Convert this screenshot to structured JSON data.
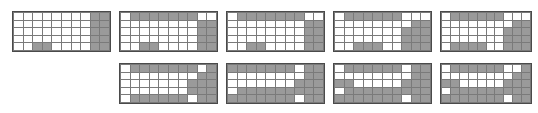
{
  "figure": {
    "type": "grid-pattern-series",
    "canvas": {
      "width": 538,
      "height": 113,
      "background": "#ffffff"
    },
    "cell_colors": {
      "filled": "#9a9a9a",
      "empty": "#ffffff",
      "gridline": "#7a7a7a",
      "border": "#4a4a4a"
    },
    "grid_shape": {
      "columns": 10,
      "rows": 5
    },
    "panel_count": 9,
    "rows_layout": [
      5,
      4
    ]
  },
  "panels": [
    {
      "id": "panel-1",
      "position": {
        "x": 12,
        "y": 11,
        "width": 99,
        "height": 41
      },
      "cells": [
        [
          0,
          0,
          0,
          0,
          0,
          0,
          0,
          0,
          1,
          1
        ],
        [
          0,
          0,
          0,
          0,
          0,
          0,
          0,
          0,
          1,
          1
        ],
        [
          0,
          0,
          0,
          0,
          0,
          0,
          0,
          0,
          1,
          1
        ],
        [
          0,
          0,
          0,
          0,
          0,
          0,
          0,
          0,
          1,
          1
        ],
        [
          0,
          0,
          1,
          1,
          0,
          0,
          0,
          0,
          1,
          1
        ]
      ]
    },
    {
      "id": "panel-2",
      "position": {
        "x": 119,
        "y": 11,
        "width": 99,
        "height": 41
      },
      "cells": [
        [
          0,
          1,
          1,
          1,
          1,
          1,
          1,
          1,
          0,
          0
        ],
        [
          0,
          0,
          0,
          0,
          0,
          0,
          0,
          0,
          1,
          1
        ],
        [
          0,
          0,
          0,
          0,
          0,
          0,
          0,
          0,
          1,
          1
        ],
        [
          0,
          0,
          0,
          0,
          0,
          0,
          0,
          0,
          1,
          1
        ],
        [
          0,
          0,
          1,
          1,
          0,
          0,
          0,
          0,
          1,
          1
        ]
      ]
    },
    {
      "id": "panel-3",
      "position": {
        "x": 226,
        "y": 11,
        "width": 99,
        "height": 41
      },
      "cells": [
        [
          0,
          1,
          1,
          1,
          1,
          1,
          1,
          1,
          0,
          0
        ],
        [
          0,
          0,
          0,
          0,
          0,
          0,
          0,
          0,
          1,
          1
        ],
        [
          0,
          0,
          0,
          0,
          0,
          0,
          0,
          0,
          1,
          1
        ],
        [
          0,
          0,
          0,
          0,
          0,
          0,
          0,
          0,
          1,
          1
        ],
        [
          0,
          0,
          1,
          1,
          0,
          0,
          0,
          0,
          1,
          1
        ]
      ]
    },
    {
      "id": "panel-4",
      "position": {
        "x": 333,
        "y": 11,
        "width": 99,
        "height": 41
      },
      "cells": [
        [
          0,
          1,
          1,
          1,
          1,
          1,
          1,
          0,
          0,
          0
        ],
        [
          0,
          0,
          0,
          0,
          0,
          0,
          0,
          0,
          1,
          1
        ],
        [
          0,
          0,
          0,
          0,
          0,
          0,
          0,
          1,
          1,
          1
        ],
        [
          0,
          0,
          0,
          0,
          0,
          0,
          0,
          1,
          1,
          1
        ],
        [
          0,
          0,
          1,
          1,
          1,
          0,
          0,
          1,
          1,
          1
        ]
      ]
    },
    {
      "id": "panel-5",
      "position": {
        "x": 440,
        "y": 11,
        "width": 92,
        "height": 41
      },
      "cells": [
        [
          0,
          1,
          1,
          1,
          1,
          1,
          1,
          0,
          0,
          0
        ],
        [
          0,
          0,
          0,
          0,
          0,
          0,
          0,
          0,
          1,
          1
        ],
        [
          0,
          0,
          0,
          0,
          0,
          0,
          0,
          1,
          1,
          1
        ],
        [
          0,
          0,
          0,
          0,
          0,
          0,
          0,
          1,
          1,
          1
        ],
        [
          0,
          1,
          1,
          1,
          1,
          0,
          0,
          1,
          1,
          1
        ]
      ]
    },
    {
      "id": "panel-6",
      "position": {
        "x": 119,
        "y": 63,
        "width": 99,
        "height": 41
      },
      "cells": [
        [
          0,
          1,
          1,
          1,
          1,
          1,
          1,
          1,
          0,
          1
        ],
        [
          0,
          0,
          0,
          0,
          0,
          0,
          0,
          0,
          1,
          1
        ],
        [
          0,
          0,
          0,
          0,
          0,
          0,
          0,
          1,
          1,
          1
        ],
        [
          0,
          0,
          0,
          0,
          0,
          0,
          0,
          1,
          1,
          1
        ],
        [
          0,
          1,
          1,
          1,
          1,
          1,
          1,
          0,
          1,
          1
        ]
      ]
    },
    {
      "id": "panel-7",
      "position": {
        "x": 226,
        "y": 63,
        "width": 99,
        "height": 41
      },
      "cells": [
        [
          1,
          1,
          1,
          1,
          1,
          1,
          1,
          0,
          1,
          1
        ],
        [
          0,
          0,
          0,
          0,
          0,
          0,
          0,
          0,
          1,
          1
        ],
        [
          0,
          0,
          0,
          0,
          0,
          0,
          0,
          1,
          1,
          1
        ],
        [
          0,
          1,
          1,
          1,
          1,
          1,
          1,
          1,
          1,
          1
        ],
        [
          1,
          1,
          1,
          1,
          1,
          1,
          1,
          0,
          1,
          1
        ]
      ]
    },
    {
      "id": "panel-8",
      "position": {
        "x": 333,
        "y": 63,
        "width": 99,
        "height": 41
      },
      "cells": [
        [
          0,
          1,
          1,
          1,
          1,
          1,
          1,
          0,
          1,
          1
        ],
        [
          0,
          0,
          0,
          0,
          0,
          0,
          0,
          0,
          1,
          1
        ],
        [
          1,
          1,
          0,
          0,
          0,
          0,
          0,
          1,
          1,
          1
        ],
        [
          0,
          1,
          1,
          1,
          1,
          1,
          1,
          1,
          1,
          1
        ],
        [
          1,
          1,
          1,
          1,
          1,
          1,
          1,
          0,
          1,
          1
        ]
      ]
    },
    {
      "id": "panel-9",
      "position": {
        "x": 440,
        "y": 63,
        "width": 92,
        "height": 41
      },
      "cells": [
        [
          0,
          1,
          1,
          1,
          1,
          1,
          1,
          0,
          0,
          1
        ],
        [
          0,
          0,
          0,
          0,
          0,
          0,
          0,
          0,
          1,
          1
        ],
        [
          1,
          1,
          0,
          0,
          0,
          0,
          0,
          1,
          1,
          1
        ],
        [
          0,
          1,
          1,
          1,
          1,
          1,
          1,
          1,
          1,
          1
        ],
        [
          1,
          1,
          1,
          1,
          1,
          1,
          1,
          0,
          1,
          1
        ]
      ]
    }
  ]
}
